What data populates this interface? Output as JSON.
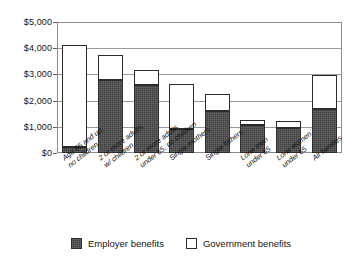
{
  "chart_data": {
    "type": "bar",
    "stacked": true,
    "title": "",
    "subtitle": "",
    "xlabel": "",
    "ylabel": "",
    "ylim": [
      0,
      5000
    ],
    "ytick_labels": [
      "$5,000",
      "$4,000",
      "$3,000",
      "$2,000",
      "$1,000",
      "$0"
    ],
    "ytick_values": [
      5000,
      4000,
      3000,
      2000,
      1000,
      0
    ],
    "grid": true,
    "legend_position": "bottom-center",
    "categories": [
      "Age 65 and up, no children",
      "2 or more adults, w/ children",
      "2 or more adults under 65, no children",
      "Single mothers",
      "Single fathers",
      "Lone men under 65",
      "Lone women under 65",
      "All families"
    ],
    "category_lines": [
      [
        "Age 65 and up,",
        "no children"
      ],
      [
        "2 or more adults,",
        "w/ children"
      ],
      [
        "2 or more adults",
        "under 65, no children"
      ],
      [
        "Single mothers"
      ],
      [
        "Single fathers"
      ],
      [
        "Lone men",
        "under 65"
      ],
      [
        "Lone women",
        "under 65"
      ],
      [
        "All families"
      ]
    ],
    "series": [
      {
        "name": "Employer benefits",
        "color": "#3f3f3f",
        "values": [
          230,
          2780,
          2590,
          920,
          1590,
          1060,
          940,
          1670
        ]
      },
      {
        "name": "Government benefits",
        "color": "#ffffff",
        "values": [
          3880,
          960,
          590,
          1710,
          660,
          210,
          270,
          1320
        ]
      }
    ],
    "totals": [
      4110,
      3740,
      3180,
      2630,
      2250,
      1270,
      1210,
      2990
    ]
  },
  "legend": {
    "items": [
      {
        "label": "Employer benefits",
        "swatch": "employer"
      },
      {
        "label": "Government benefits",
        "swatch": "government"
      }
    ]
  },
  "colors": {
    "employer_fill": "#3f3f3f",
    "government_fill": "#ffffff",
    "bar_border": "#2b2b2b",
    "gridline": "#9a9a9a",
    "frame": "#8c8c8c",
    "text": "#141414",
    "background": "#ffffff"
  }
}
